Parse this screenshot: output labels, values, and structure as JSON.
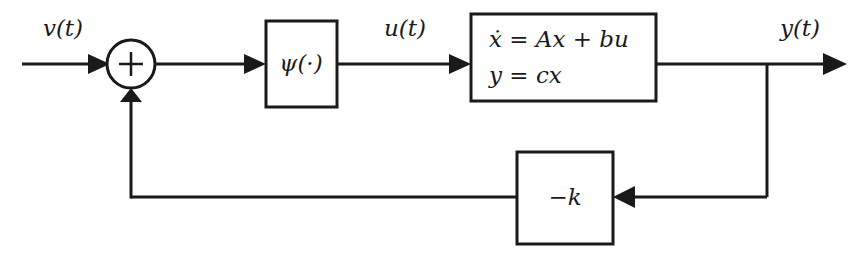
{
  "diagram": {
    "type": "control-system-block-diagram",
    "background_color": "#ffffff",
    "line_color": "#1a1a1a"
  },
  "signals": {
    "input": "v(t)",
    "control": "u(t)",
    "output": "y(t)"
  },
  "summing_junction": {
    "sign": "+",
    "inputs": [
      "v(t)",
      "feedback"
    ],
    "output": "to nonlinearity"
  },
  "blocks": [
    {
      "id": "nonlinearity",
      "label": "ψ(·)",
      "label_parts": {
        "symbol": "ψ",
        "argument": "(·)"
      }
    },
    {
      "id": "plant",
      "label_line1": "ẋ = Ax + bu",
      "label_line2": "y = cx",
      "line1_parts": {
        "state_dot": "ẋ",
        "eq": "=",
        "a_term": "Ax",
        "plus": "+",
        "b_term": "bu"
      },
      "line2_parts": {
        "output_var": "y",
        "eq": "=",
        "c_term": "cx"
      }
    },
    {
      "id": "feedback_gain",
      "label": "−k",
      "label_parts": {
        "minus": "−",
        "gain": "k"
      }
    }
  ],
  "connections": [
    {
      "from": "input",
      "to": "summing_junction",
      "label": "v(t)"
    },
    {
      "from": "summing_junction",
      "to": "nonlinearity",
      "label": ""
    },
    {
      "from": "nonlinearity",
      "to": "plant",
      "label": "u(t)"
    },
    {
      "from": "plant",
      "to": "output",
      "label": "y(t)"
    },
    {
      "from": "output_branch",
      "to": "feedback_gain",
      "label": ""
    },
    {
      "from": "feedback_gain",
      "to": "summing_junction",
      "label": ""
    }
  ]
}
